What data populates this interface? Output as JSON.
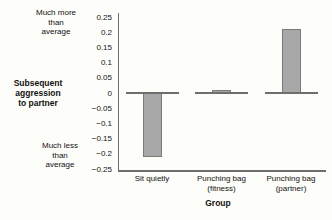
{
  "figure": {
    "y_axis_annotation_top": "Much more\nthan\naverage",
    "y_axis_title": "Subsequent\naggression\nto partner",
    "y_axis_annotation_bottom": "Much less\nthan\naverage",
    "x_axis_title": "Group"
  },
  "chart_data": {
    "type": "bar",
    "categories": [
      "Sit quietly",
      "Punching bag\n(fitness)",
      "Punching bag\n(partner)"
    ],
    "values": [
      -0.21,
      0.01,
      0.21
    ],
    "title": "",
    "xlabel": "Group",
    "ylabel": "Subsequent aggression to partner",
    "ylabel_scale_notes": [
      "Much more than average",
      "Much less than average"
    ],
    "y_ticks": [
      0.25,
      0.2,
      0.15,
      0.1,
      0.05,
      0,
      -0.05,
      -0.1,
      -0.15,
      -0.2,
      -0.25
    ],
    "ylim": [
      -0.25,
      0.25
    ],
    "grid": false,
    "legend": false,
    "zero_line_per_category": true,
    "bar_color": "#a8a8a8",
    "bar_border_color": "#7a7a7a",
    "axis_color": "#6e6e6e"
  }
}
